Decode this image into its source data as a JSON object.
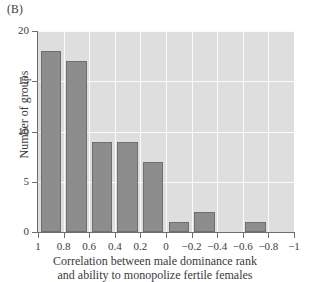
{
  "panel": {
    "label": "(B)"
  },
  "chart_data": {
    "type": "bar",
    "title": "",
    "subtitle": "",
    "panel_label": "(B)",
    "xlabel_line1": "Correlation between male dominance rank",
    "xlabel_line2": "and ability to monopolize fertile females",
    "ylabel": "Number of groups",
    "xlim": [
      1,
      -1
    ],
    "ylim": [
      0,
      20
    ],
    "x_axis_inverted": true,
    "grid": true,
    "legend": "none",
    "bin_width": 0.2,
    "bin_edges": [
      1,
      0.8,
      0.6,
      0.4,
      0.2,
      0,
      -0.2,
      -0.4,
      -0.6,
      -0.8,
      -1
    ],
    "bin_labels": [
      "1 to 0.8",
      "0.8 to 0.6",
      "0.6 to 0.4",
      "0.4 to 0.2",
      "0.2 to 0",
      "0 to -0.2",
      "-0.2 to -0.4",
      "-0.4 to -0.6",
      "-0.6 to -0.8",
      "-0.8 to -1"
    ],
    "values": [
      18,
      17,
      9,
      9,
      7,
      1,
      2,
      0,
      1,
      0
    ],
    "xticks": [
      1,
      0.8,
      0.6,
      0.4,
      0.2,
      0,
      -0.2,
      -0.4,
      -0.6,
      -0.8,
      -1
    ],
    "xtick_labels": [
      "1",
      "0.8",
      "0.6",
      "0.4",
      "0.2",
      "0",
      "−0.2",
      "−0.4",
      "−0.6",
      "−0.8",
      "−1"
    ],
    "yticks": [
      0,
      5,
      10,
      15,
      20
    ],
    "ytick_labels": [
      "0",
      "5",
      "10",
      "15",
      "20"
    ],
    "colors": {
      "bar_fill": "#8d8d8d",
      "bar_edge": "#6f6f6f",
      "plot_background": "#dedede",
      "gridline": "#fbfbfb",
      "axis": "#6e6e6e",
      "text": "#3a3a3a",
      "figure_background": "#ffffff"
    }
  }
}
